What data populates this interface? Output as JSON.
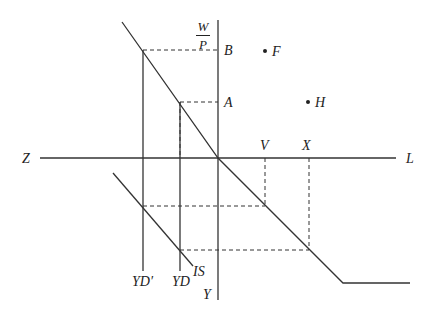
{
  "diagram": {
    "type": "economics four-quadrant labor market / IS diagram",
    "colors": {
      "line": "#333333",
      "background": "#ffffff"
    },
    "axes": {
      "vertical_label_numerator": "W",
      "vertical_label_denominator": "P",
      "vertical_bottom_label": "Y",
      "horizontal_left_label": "Z",
      "horizontal_right_label": "L"
    },
    "vertical_axis_points": {
      "upper": "B",
      "lower": "A"
    },
    "points": {
      "f": "F",
      "h": "H"
    },
    "horizontal_axis_points": {
      "first": "V",
      "second": "X"
    },
    "curves": {
      "yd_prime": "YD′",
      "yd": "YD",
      "is": "IS"
    },
    "dot": "•"
  }
}
